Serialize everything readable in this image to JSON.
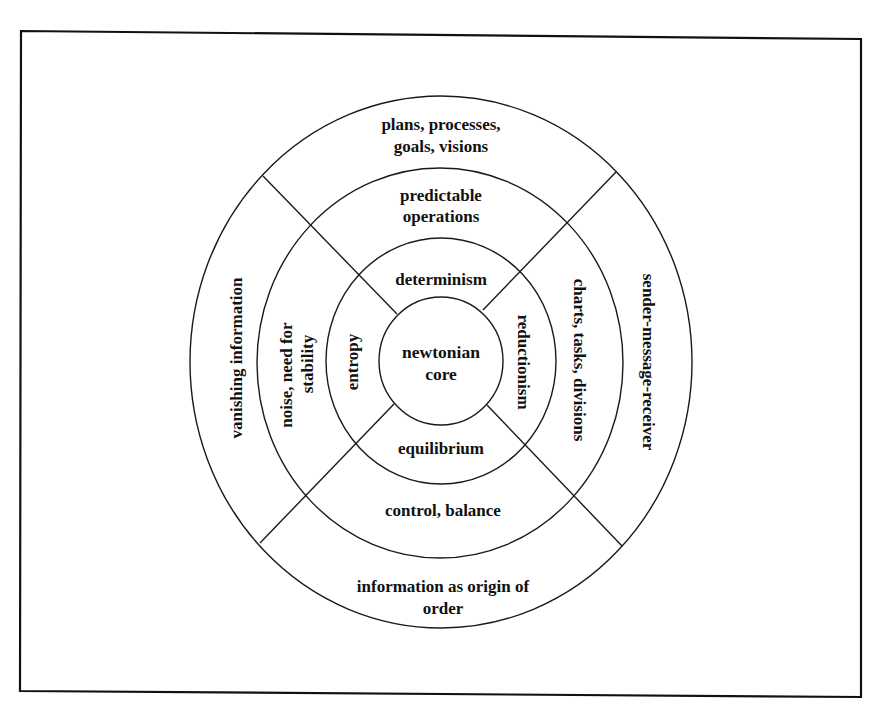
{
  "diagram": {
    "title": "",
    "center": {
      "line1": "newtonian",
      "line2": "core"
    },
    "ring1": {
      "top": "determinism",
      "right": "reductionism",
      "bottom": "equilibrium",
      "left": "entropy"
    },
    "ring2": {
      "top_line1": "predictable",
      "top_line2": "operations",
      "right": "charts, tasks, divisions",
      "bottom": "control, balance",
      "left_line1": "noise, need for",
      "left_line2": "stability"
    },
    "ring3": {
      "top_line1": "plans, processes,",
      "top_line2": "goals, visions",
      "right": "sender-message-receiver",
      "bottom_line1": "information as origin of",
      "bottom_line2": "order",
      "left": "vanishing information"
    },
    "colors": {
      "line": "#1a1a1a",
      "text": "#111111",
      "background": "#ffffff"
    }
  }
}
